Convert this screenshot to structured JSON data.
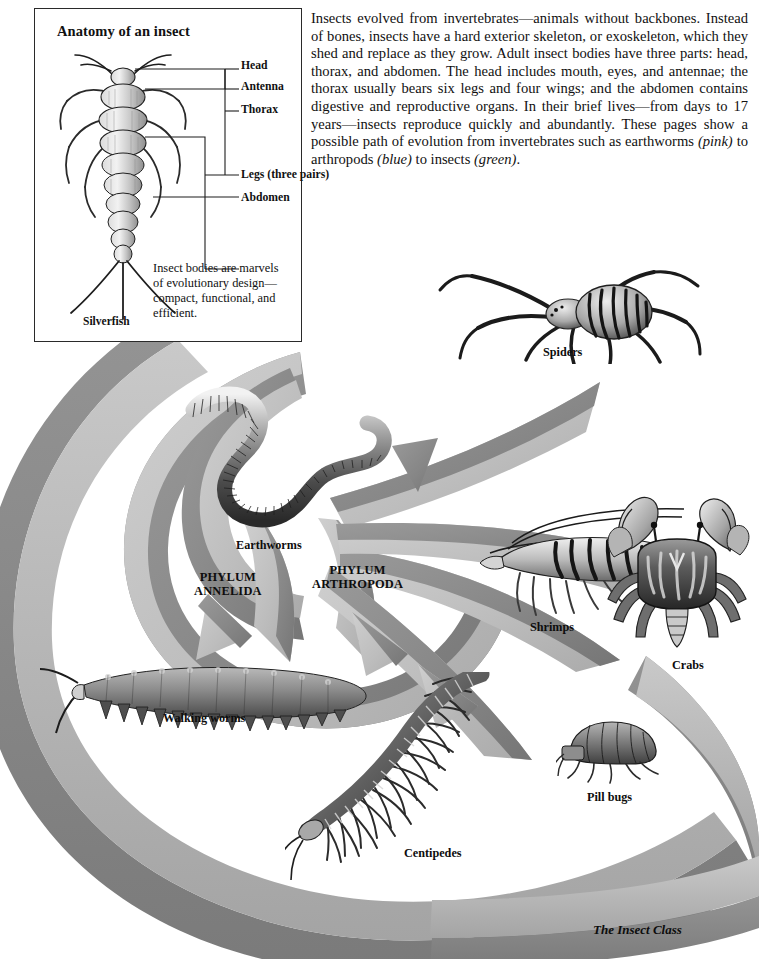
{
  "page": {
    "background": "#ffffff",
    "width": 759,
    "height": 959
  },
  "body_copy": {
    "paragraph": "Insects evolved from invertebrates—animals without backbones. Instead of bones, insects have a hard exterior skeleton, or exoskeleton, which they shed and replace as they grow. Adult insect bodies have three parts: head, thorax, and abdomen. The head includes mouth, eyes, and antennae; the thorax usually bears six legs and four wings; and the abdomen contains digestive and reproductive organs. In their brief lives—from days to 17 years—insects reproduce quickly and abundantly. These pages show a possible path of evolution from invertebrates such as earthworms ",
    "pink": "(pink)",
    "mid1": " to arthropods ",
    "blue": "(blue)",
    "mid2": " to insects ",
    "green": "(green)",
    "end": "."
  },
  "anatomy": {
    "title": "Anatomy of an insect",
    "specimen_label": "Silverfish",
    "note": "Insect bodies are marvels of evolutionary design—compact, functional, and efficient.",
    "labels": [
      {
        "text": "Head",
        "x": 206,
        "y": 55
      },
      {
        "text": "Antenna",
        "x": 206,
        "y": 76
      },
      {
        "text": "Thorax",
        "x": 206,
        "y": 99
      },
      {
        "text": "Legs (three pairs)",
        "x": 206,
        "y": 164
      },
      {
        "text": "Abdomen",
        "x": 206,
        "y": 187
      }
    ]
  },
  "diagram": {
    "groups": [
      {
        "name": "earthworms",
        "label": "Earthworms",
        "x": 236,
        "y": 538,
        "kind": "organism"
      },
      {
        "name": "spiders",
        "label": "Spiders",
        "x": 543,
        "y": 345,
        "kind": "organism"
      },
      {
        "name": "shrimps",
        "label": "Shrimps",
        "x": 530,
        "y": 620,
        "kind": "organism"
      },
      {
        "name": "crabs",
        "label": "Crabs",
        "x": 672,
        "y": 658,
        "kind": "organism"
      },
      {
        "name": "walking-worms",
        "label": "Walking worms",
        "x": 163,
        "y": 711,
        "kind": "organism"
      },
      {
        "name": "centipedes",
        "label": "Centipedes",
        "x": 404,
        "y": 846,
        "kind": "organism"
      },
      {
        "name": "pill-bugs",
        "label": "Pill bugs",
        "x": 587,
        "y": 790,
        "kind": "organism"
      }
    ],
    "phyla": [
      {
        "name": "annelida",
        "line1": "PHYLUM",
        "line2": "ANNELIDA",
        "x": 194,
        "y": 578
      },
      {
        "name": "arthropoda",
        "line1": "PHYLUM",
        "line2": "ARTHROPODA",
        "x": 312,
        "y": 571
      }
    ],
    "insect_class": {
      "label": "The Insect Class",
      "x": 593,
      "y": 922
    },
    "colors": {
      "ribbon_light": "#c3c3c3",
      "ribbon_mid": "#b0b0b0",
      "ribbon_dark": "#8f8f8f",
      "ribbon_darker": "#7d7d7d",
      "outline": "#2a2a2a",
      "ink": "#111111"
    }
  }
}
